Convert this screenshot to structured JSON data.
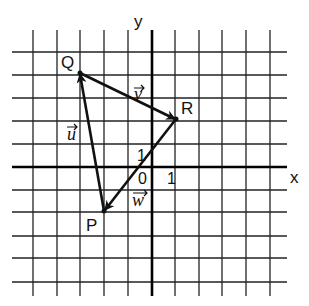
{
  "axes": {
    "x_label": "x",
    "y_label": "y",
    "origin_label": "0",
    "x_unit_label": "1",
    "y_unit_label": "1"
  },
  "grid": {
    "x_range": [
      -5,
      5
    ],
    "y_range": [
      -5,
      5
    ],
    "line_color": "#222222"
  },
  "points": [
    {
      "name": "Q",
      "x": -3,
      "y": 4
    },
    {
      "name": "R",
      "x": 1,
      "y": 2
    },
    {
      "name": "P",
      "x": -2,
      "y": -2
    }
  ],
  "vectors": [
    {
      "label": "v",
      "from": "Q",
      "to": "R"
    },
    {
      "label": "w",
      "from": "R",
      "to": "P"
    },
    {
      "label": "u",
      "from": "P",
      "to": "Q"
    }
  ],
  "labels": {
    "Q": "Q",
    "R": "R",
    "P": "P",
    "u": "u",
    "v": "v",
    "w": "w"
  }
}
